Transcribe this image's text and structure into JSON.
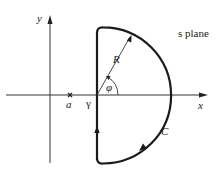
{
  "diagram": {
    "title": "s plane",
    "axes": {
      "x_label": "x",
      "y_label": "y"
    },
    "points": {
      "pole_label": "a",
      "intercept_label": "γ"
    },
    "contour": {
      "label": "C",
      "radius_label": "R",
      "angle_label": "φ",
      "direction": "counterclockwise"
    },
    "colors": {
      "stroke": "#1a1a1a",
      "axis": "#333333",
      "background": "#ffffff"
    }
  }
}
